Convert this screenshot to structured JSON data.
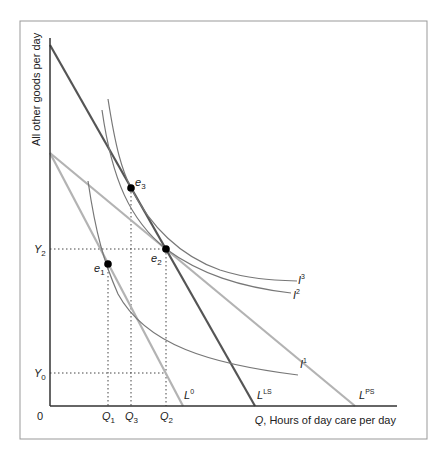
{
  "diagram": {
    "y_axis_label": "All other goods per day",
    "x_axis_label_var": "Q",
    "x_axis_label_rest": ", Hours of day care per day",
    "origin": "0",
    "y_ticks": [
      {
        "base": "Y",
        "sub": "2"
      },
      {
        "base": "Y",
        "sub": "0"
      }
    ],
    "x_ticks": [
      {
        "base": "Q",
        "sub": "1"
      },
      {
        "base": "Q",
        "sub": "3"
      },
      {
        "base": "Q",
        "sub": "2"
      }
    ],
    "budget_lines": [
      {
        "base": "L",
        "sup": "0",
        "color": "#b3b3b3"
      },
      {
        "base": "L",
        "sup": "LS",
        "color": "#555555"
      },
      {
        "base": "L",
        "sup": "PS",
        "color": "#b3b3b3"
      }
    ],
    "indifference_curves": [
      {
        "base": "I",
        "sup": "1"
      },
      {
        "base": "I",
        "sup": "2"
      },
      {
        "base": "I",
        "sup": "3"
      }
    ],
    "equilibria": [
      {
        "base": "e",
        "sub": "1"
      },
      {
        "base": "e",
        "sub": "2"
      },
      {
        "base": "e",
        "sub": "3"
      }
    ],
    "colors": {
      "axis": "#333333",
      "frame": "#999999",
      "curve": "#666666",
      "dotted": "#444444"
    }
  }
}
